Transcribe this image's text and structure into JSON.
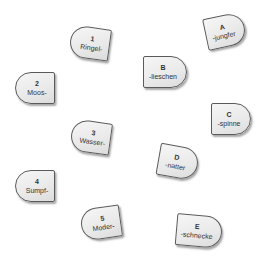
{
  "prefixes": [
    {
      "id": "1",
      "word": "Ringel-"
    },
    {
      "id": "2",
      "word": "Moos-"
    },
    {
      "id": "3",
      "word": "Wasser-"
    },
    {
      "id": "4",
      "word": "Sumpf-"
    },
    {
      "id": "5",
      "word": "Moder-"
    }
  ],
  "suffixes": [
    {
      "id": "A",
      "word": "-jungfer"
    },
    {
      "id": "B",
      "word": "-lieschen"
    },
    {
      "id": "C",
      "word": "-spinne"
    },
    {
      "id": "D",
      "word": "-natter"
    },
    {
      "id": "E",
      "word": "-schnecke"
    }
  ],
  "colors": {
    "piece_fill": "#eaeaea",
    "piece_border": "#5a5a5a",
    "text": "#333333",
    "background": "#ffffff"
  }
}
